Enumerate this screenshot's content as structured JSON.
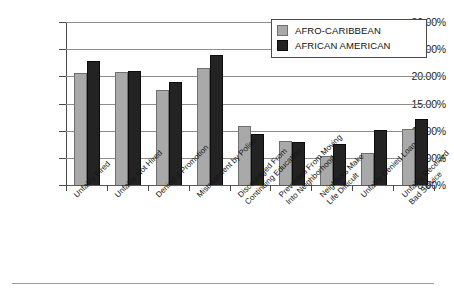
{
  "chart_data": {
    "type": "bar",
    "title": "",
    "subtitle": "",
    "xlabel": "",
    "ylabel": "",
    "ylim": [
      0,
      30
    ],
    "ytick_values": [
      0,
      5,
      10,
      15,
      20,
      25,
      30
    ],
    "ytick_labels": [
      "0.00%",
      "5.00%",
      "10.00%",
      "15.00%",
      "20.00%",
      "25.00%",
      "30.00%"
    ],
    "grid": true,
    "grid_axis": "y",
    "legend_position": "top-right",
    "value_suffix": "%",
    "categories": [
      "Unfairly Fired",
      "Unfairly Not Hired",
      "Denied a Promotion",
      "Mistreatment by Police",
      "Discouraged From Continuing Education",
      "Prevented From Moving Into Neighborhood",
      "Neighbors Make Life Difficult",
      "Unfairly Denied Loan",
      "Unfairly Received Bad Service"
    ],
    "category_lines": [
      [
        "Unfairly Fired",
        ""
      ],
      [
        "Unfairly Not Hired",
        ""
      ],
      [
        "Denied a Promotion",
        ""
      ],
      [
        "Mistreatment by Police",
        ""
      ],
      [
        "Discouraged From",
        "Continuing Education"
      ],
      [
        "Prevented From Moving",
        "Into Neighborhood"
      ],
      [
        "Neighbors Make",
        "Life Difficult"
      ],
      [
        "Unfairly Denied Loan",
        ""
      ],
      [
        "Unfairly Received",
        "Bad Service"
      ]
    ],
    "series": [
      {
        "name": "AFRO-CARIBBEAN",
        "color": "#a9a9a9",
        "values": [
          20.7,
          20.8,
          17.4,
          21.5,
          10.8,
          8.1,
          5.4,
          5.9,
          10.3
        ]
      },
      {
        "name": "AFRICAN AMERICAN",
        "color": "#232323",
        "values": [
          22.9,
          21.0,
          18.9,
          24.0,
          9.3,
          8.0,
          7.5,
          10.1,
          12.2
        ]
      }
    ]
  },
  "legend": {
    "entries": [
      {
        "label": "AFRO-CARIBBEAN"
      },
      {
        "label": "AFRICAN AMERICAN"
      }
    ]
  }
}
